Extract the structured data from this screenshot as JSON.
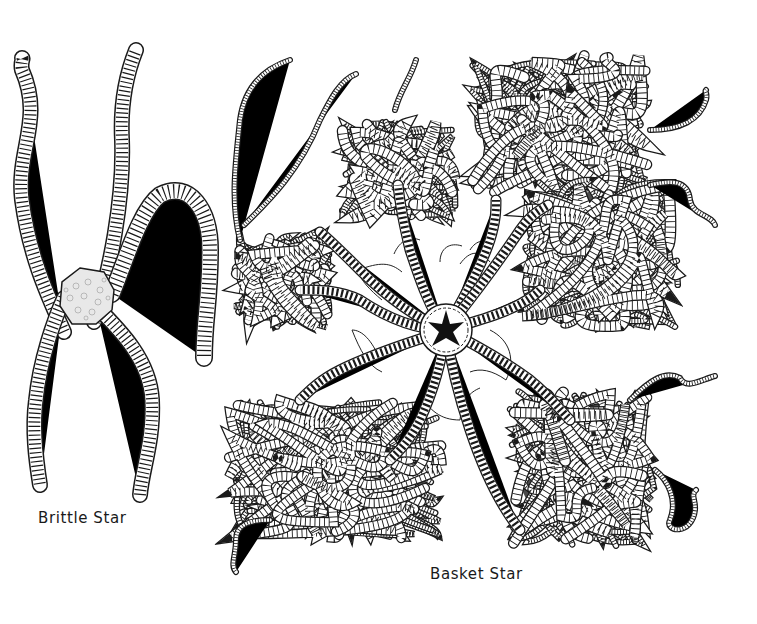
{
  "figure": {
    "colors": {
      "background": "#ffffff",
      "ink": "#1a1a1a",
      "disc_fill": "#e8e8e8"
    },
    "specimens": [
      {
        "id": "brittle",
        "caption": "Brittle Star",
        "arm_count": 5
      },
      {
        "id": "basket",
        "caption": "Basket Star",
        "arm_count": 5
      }
    ]
  }
}
